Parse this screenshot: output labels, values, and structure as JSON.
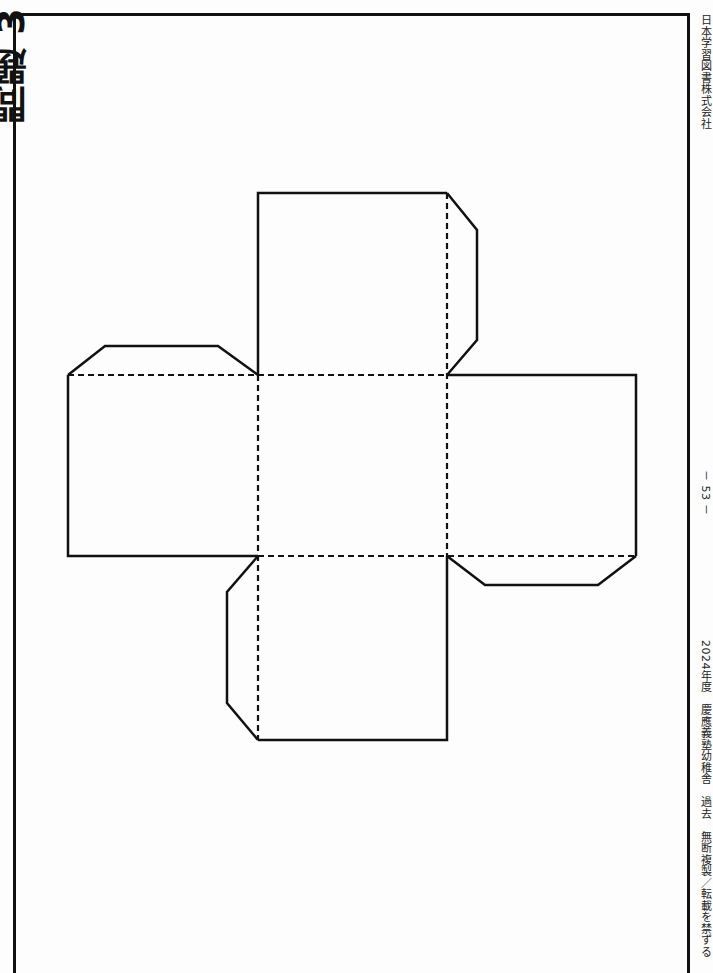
{
  "page": {
    "left_heading_fragment": "問題 3",
    "publisher": "日本学習図書株式会社",
    "page_number": "－ 53 －",
    "copyright_notice": "2024年度　慶應義塾幼稚舎　過去　無断複製／転載を禁ずる"
  },
  "figure": {
    "faces": [
      {
        "name": "top",
        "x": 258,
        "y": 193,
        "w": 189,
        "h": 182
      },
      {
        "name": "left",
        "x": 68,
        "y": 375,
        "w": 190,
        "h": 181
      },
      {
        "name": "center",
        "x": 258,
        "y": 375,
        "w": 189,
        "h": 181
      },
      {
        "name": "right",
        "x": 447,
        "y": 375,
        "w": 189,
        "h": 181
      },
      {
        "name": "bottom",
        "x": 258,
        "y": 556,
        "w": 189,
        "h": 184
      }
    ],
    "tabs": [
      {
        "name": "left-face-top-tab",
        "points": "68,375 105,346 218,346 258,375"
      },
      {
        "name": "top-face-right-tab",
        "points": "447,193 477,230 477,340 447,375"
      },
      {
        "name": "right-face-bottom-tab",
        "points": "447,556 485,585 598,585 636,556"
      },
      {
        "name": "bottom-face-left-tab",
        "points": "258,556 227,592 227,703 258,740"
      }
    ],
    "line_color": "#111111"
  }
}
